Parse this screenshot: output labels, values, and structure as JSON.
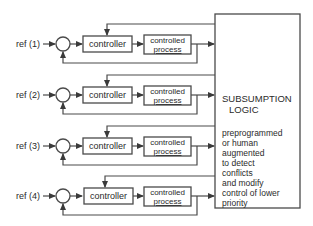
{
  "diagram": {
    "rows": [
      {
        "ref_label": "ref (1)",
        "controller_label": "controller",
        "process_label_line1": "controlled",
        "process_label_line2": "process"
      },
      {
        "ref_label": "ref (2)",
        "controller_label": "controller",
        "process_label_line1": "controlled",
        "process_label_line2": "process"
      },
      {
        "ref_label": "ref (3)",
        "controller_label": "controller",
        "process_label_line1": "controlled",
        "process_label_line2": "process"
      },
      {
        "ref_label": "ref (4)",
        "controller_label": "controller",
        "process_label_line1": "controlled",
        "process_label_line2": "process"
      }
    ],
    "subsumption": {
      "title_line1": "SUBSUMPTION",
      "title_line2": "LOGIC",
      "description_lines": [
        "preprogrammed",
        "or human",
        "augmented",
        "to detect",
        "conflicts",
        "and modify",
        "control of lower",
        "priority",
        "subsystem"
      ]
    },
    "colors": {
      "line": "#4a4a4a",
      "text": "#2a2a2a",
      "background": "#ffffff"
    }
  }
}
